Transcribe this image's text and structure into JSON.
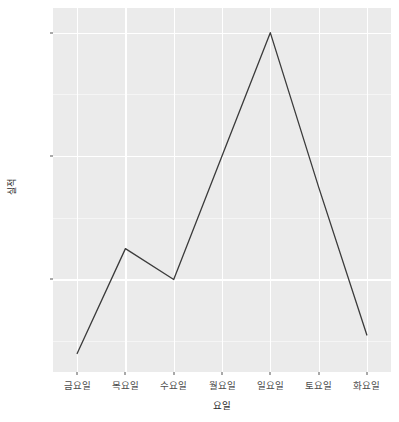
{
  "chart_data": {
    "type": "line",
    "title": "",
    "subtitle": "",
    "xlabel": "요일",
    "ylabel": "실적",
    "categories": [
      "금요일",
      "목요일",
      "수요일",
      "월요일",
      "일요일",
      "토요일",
      "화요일"
    ],
    "values": [
      68,
      85,
      80,
      100,
      120,
      95,
      71
    ],
    "series": [
      {
        "name": "실적",
        "values": [
          68,
          85,
          80,
          100,
          120,
          95,
          71
        ]
      }
    ],
    "ylim": [
      65,
      124
    ],
    "y_ticks": [
      80,
      100,
      120
    ],
    "y_tick_labels": [
      "80",
      "100",
      "120"
    ],
    "y_minor_ticks": [
      70,
      90,
      110
    ],
    "grid": true,
    "grid_color": "#ffffff",
    "panel_color": "#ebebeb",
    "line_color": "#3b3b3b",
    "line_width": 1.2,
    "legend": "none",
    "legend_position": "none",
    "annotations": []
  },
  "axes": {
    "y_title": "실적",
    "x_title": "요일"
  }
}
